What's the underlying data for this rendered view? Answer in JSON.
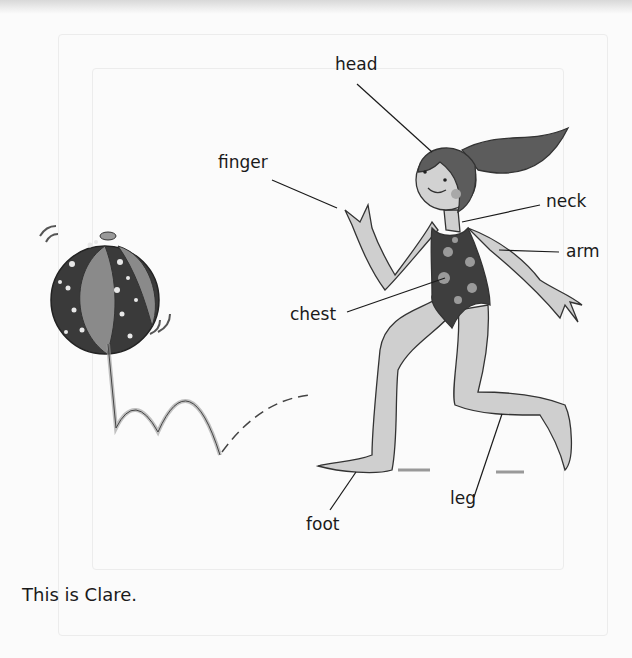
{
  "page": {
    "caption": "This is Clare."
  },
  "labels": {
    "head": "head",
    "finger": "finger",
    "neck": "neck",
    "arm": "arm",
    "chest": "chest",
    "leg": "leg",
    "foot": "foot"
  },
  "illustration": {
    "subject": "girl running in swimsuit",
    "object": "beach ball bouncing"
  }
}
